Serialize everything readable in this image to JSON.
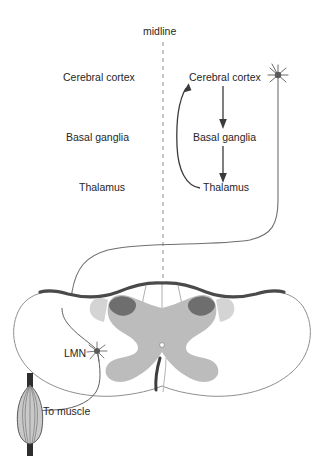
{
  "figure": {
    "type": "diagram",
    "width": 323,
    "height": 467,
    "background": "#ffffff"
  },
  "midline": {
    "label": "midline",
    "x": 163,
    "y_top": 42,
    "y_bottom": 300,
    "style": "dashed",
    "color": "#8a8a8a"
  },
  "left_column": {
    "note": "Ipsilateral / unlabeled-side structure names (text only, no boxes)",
    "items": [
      {
        "label": "Cerebral cortex",
        "x": 63,
        "y": 78
      },
      {
        "label": "Basal ganglia",
        "x": 66,
        "y": 138
      },
      {
        "label": "Thalamus",
        "x": 79,
        "y": 188
      }
    ]
  },
  "right_column": {
    "note": "Contralateral loop with directional arrows",
    "items": [
      {
        "label": "Cerebral cortex",
        "x": 189,
        "y": 78
      },
      {
        "label": "Basal ganglia",
        "x": 193,
        "y": 138
      },
      {
        "label": "Thalamus",
        "x": 203,
        "y": 188
      }
    ],
    "arrows": [
      {
        "from": "Cerebral cortex",
        "to": "Basal ganglia",
        "shape": "straight-down",
        "x": 223,
        "y1": 86,
        "y2": 128
      },
      {
        "from": "Basal ganglia",
        "to": "Thalamus",
        "shape": "straight-down",
        "x": 223,
        "y1": 146,
        "y2": 182
      },
      {
        "from": "Thalamus",
        "to": "Cerebral cortex",
        "shape": "curved-left-feedback",
        "x1": 196,
        "y1": 188,
        "x2": 188,
        "y2": 84
      }
    ]
  },
  "neurons": [
    {
      "name": "upper-motor-neuron",
      "label": "",
      "x": 278,
      "y": 75,
      "description": "star-shaped cell body at right of cerebral cortex, axon descends and decussates"
    },
    {
      "name": "lower-motor-neuron",
      "label": "LMN",
      "label_x": 64,
      "label_y": 355,
      "soma_x": 97,
      "soma_y": 351,
      "description": "star-shaped cell body in ventral horn of left gray matter"
    }
  ],
  "annotations": [
    {
      "name": "to-muscle-label",
      "label": "To muscle",
      "x": 43,
      "y": 413
    }
  ],
  "muscle": {
    "name": "skeletal-muscle",
    "shape": "fusiform spindle with tendons",
    "cx": 30,
    "top_y": 375,
    "bottom_y": 455,
    "fill": "#cfcfcf",
    "tendon_color": "#2e2e2e"
  },
  "spinal_cord": {
    "name": "spinal-cord-cross-section",
    "outline_color": "#8a8a8a",
    "dorsal_rim_color": "#4a4a4a",
    "gray_matter_color": "#b9b9b9",
    "dorsal_horn_cap_color": "#6e6e6e",
    "ventral_band_color": "#d6d6d6",
    "central_canal": {
      "x": 162,
      "y": 345
    },
    "features": [
      "dorsal columns with thin septa",
      "butterfly gray matter",
      "darker dorsal horn caps",
      "ventral median fissure",
      "central canal"
    ]
  },
  "pathway": {
    "name": "corticospinal-tract",
    "description": "UMN axon descends on the right, decussates across the midline, and synapses on the LMN in the left ventral horn; LMN axon exits ventrally to the muscle",
    "stroke": "#6f6f6f"
  },
  "colors": {
    "text": "#262626",
    "arrow": "#3a3a3a",
    "midline": "#8a8a8a",
    "tract": "#6f6f6f",
    "gray_matter": "#b9b9b9",
    "dorsal_cap": "#6e6e6e",
    "cord_rim": "#4a4a4a"
  }
}
